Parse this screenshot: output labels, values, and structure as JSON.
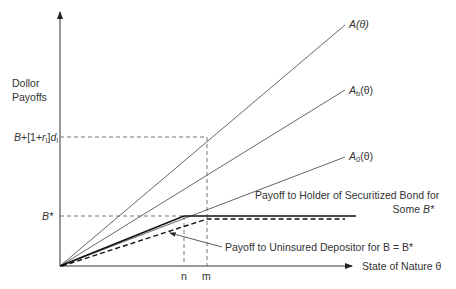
{
  "diagram": {
    "y_axis_label_line1": "Dollor",
    "y_axis_label_line2": "Payoffs",
    "x_axis_label": "State of Nature θ",
    "y_tick_high": "B+[1+r",
    "y_tick_high_sub": "I",
    "y_tick_high_end": "]d",
    "y_tick_high_sub2": "I",
    "y_tick_bstar": "B*",
    "x_tick_n": "n",
    "x_tick_m": "m",
    "line_A": "A(θ)",
    "line_Ab": "A",
    "line_Ab_sub": "b",
    "line_Ab_suffix": "(θ)",
    "line_A0": "A",
    "line_A0_sub": "0",
    "line_A0_suffix": "(θ)",
    "annot_bond_line1": "Payoff to Holder of Securitized Bond for",
    "annot_bond_line2": "Some B*",
    "annot_depositor": "Payoff to Uninsured Depositor for B = B*"
  }
}
